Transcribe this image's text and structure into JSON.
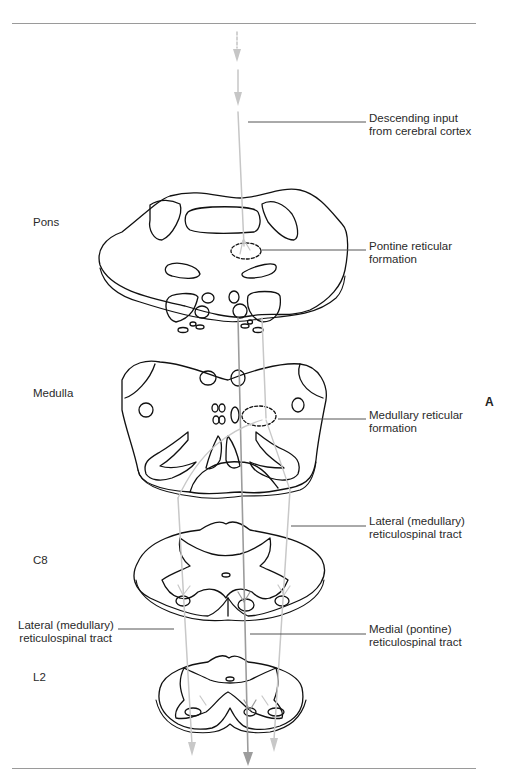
{
  "figure": {
    "panel_letter": "A",
    "levels": [
      {
        "id": "pons",
        "label": "Pons"
      },
      {
        "id": "medulla",
        "label": "Medulla"
      },
      {
        "id": "c8",
        "label": "C8"
      },
      {
        "id": "l2",
        "label": "L2"
      }
    ],
    "callouts": {
      "descending_input": {
        "line1": "Descending input",
        "line2": "from cerebral cortex"
      },
      "pontine_rf": {
        "line1": "Pontine reticular",
        "line2": "formation"
      },
      "medullary_rf": {
        "line1": "Medullary reticular",
        "line2": "formation"
      },
      "lateral_tract_right": {
        "line1": "Lateral (medullary)",
        "line2": "reticulospinal tract"
      },
      "lateral_tract_left": {
        "line1": "Lateral (medullary)",
        "line2": "reticulospinal tract"
      },
      "medial_tract": {
        "line1": "Medial (pontine)",
        "line2": "reticulospinal tract"
      }
    },
    "colors": {
      "outline": "#111111",
      "medial_tract": "#9c9c9c",
      "lateral_tract": "#c8c8c8",
      "leader_line": "#555555",
      "rule": "#9a9a9a"
    }
  }
}
